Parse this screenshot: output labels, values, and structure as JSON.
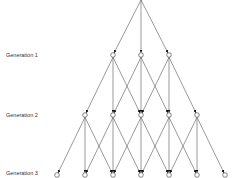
{
  "diagram": {
    "labels": [
      {
        "text": "Generation 1",
        "y": 55
      },
      {
        "text": "Generation 2",
        "y": 115
      },
      {
        "text": "Generation 3",
        "y": 175
      }
    ],
    "root": {
      "x": 141,
      "y": 0
    },
    "spacing_x": 28,
    "generations": [
      {
        "y": 55,
        "xs": [
          113,
          141,
          169
        ]
      },
      {
        "y": 115,
        "xs": [
          85,
          113,
          141,
          169,
          197
        ]
      },
      {
        "y": 175,
        "xs": [
          57,
          85,
          113,
          141,
          169,
          197,
          225
        ]
      }
    ],
    "colors": {
      "line": "#555555",
      "node_fill": "#ffffff",
      "node_stroke": "#333333",
      "arrow": "#111111"
    }
  }
}
